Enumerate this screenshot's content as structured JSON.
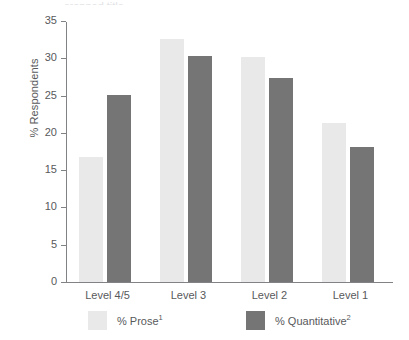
{
  "chart_data": {
    "type": "bar",
    "title": "",
    "xlabel": "",
    "ylabel": "% Respondents",
    "categories": [
      "Level 4/5",
      "Level 3",
      "Level 2",
      "Level 1"
    ],
    "series": [
      {
        "name": "% Prose",
        "footnote": "1",
        "color": "#e9e9e9",
        "values": [
          16.8,
          32.6,
          30.2,
          21.3
        ]
      },
      {
        "name": "% Quantitative",
        "footnote": "2",
        "color": "#757575",
        "values": [
          25.1,
          30.3,
          27.4,
          18.1
        ]
      }
    ],
    "ylim": [
      0,
      35
    ],
    "yticks": [
      0,
      5,
      10,
      15,
      20,
      25,
      30,
      35
    ],
    "ytick_labels": [
      "0",
      "5",
      "10",
      "15",
      "20",
      "25",
      "30",
      "35"
    ],
    "grid": false,
    "legend_position": "bottom"
  },
  "axis": {
    "y_title": "% Respondents"
  },
  "legend": {
    "items": [
      {
        "label": "% Prose",
        "sup": "1"
      },
      {
        "label": "% Quantitative",
        "sup": "2"
      }
    ]
  },
  "title_remnant": "cropped title"
}
